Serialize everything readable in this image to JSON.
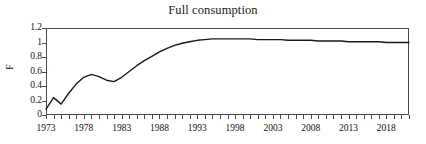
{
  "chart_data": {
    "type": "line",
    "title": "Full consumption",
    "xlabel": "",
    "ylabel": "F",
    "xlim": [
      1973,
      2021
    ],
    "ylim": [
      0,
      1.2
    ],
    "grid": false,
    "legend": null,
    "y_ticks": [
      "1.2",
      "1",
      "0.8",
      "0.6",
      "0.4",
      "0.2",
      "0"
    ],
    "y_tick_values": [
      1.2,
      1,
      0.8,
      0.6,
      0.4,
      0.2,
      0
    ],
    "x_ticks": [
      "1973",
      "1978",
      "1983",
      "1988",
      "1993",
      "1998",
      "2003",
      "2008",
      "2013",
      "2018"
    ],
    "x_tick_values": [
      1973,
      1978,
      1983,
      1988,
      1993,
      1998,
      2003,
      2008,
      2013,
      2018
    ],
    "x_minor_step": 1,
    "line_color": "#1a1a1a",
    "axis_color": "#4a4a4a",
    "background": "#ffffff",
    "series": [
      {
        "name": "F",
        "x": [
          1973,
          1974,
          1975,
          1976,
          1977,
          1978,
          1979,
          1980,
          1981,
          1982,
          1983,
          1984,
          1985,
          1986,
          1987,
          1988,
          1989,
          1990,
          1991,
          1992,
          1993,
          1994,
          1995,
          1996,
          1997,
          1998,
          1999,
          2000,
          2001,
          2002,
          2003,
          2004,
          2005,
          2006,
          2007,
          2008,
          2009,
          2010,
          2011,
          2012,
          2013,
          2014,
          2015,
          2016,
          2017,
          2018,
          2019,
          2020,
          2021
        ],
        "values": [
          0.08,
          0.24,
          0.15,
          0.3,
          0.43,
          0.52,
          0.56,
          0.53,
          0.48,
          0.46,
          0.52,
          0.6,
          0.68,
          0.75,
          0.81,
          0.87,
          0.92,
          0.96,
          0.99,
          1.01,
          1.03,
          1.04,
          1.05,
          1.05,
          1.05,
          1.05,
          1.05,
          1.05,
          1.04,
          1.04,
          1.04,
          1.04,
          1.03,
          1.03,
          1.03,
          1.03,
          1.02,
          1.02,
          1.02,
          1.02,
          1.01,
          1.01,
          1.01,
          1.01,
          1.01,
          1.0,
          1.0,
          1.0,
          1.0
        ]
      }
    ]
  }
}
